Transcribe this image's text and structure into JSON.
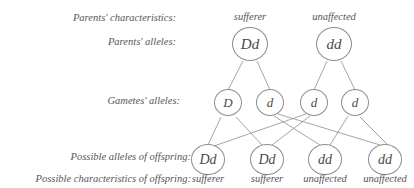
{
  "figure": {
    "type": "genetic-cross-diagram",
    "background": "#ffffff",
    "stroke_color": "#8e8e8e",
    "text_color": "#565656"
  },
  "row_labels": {
    "parents_characteristics": "Parents' characteristics:",
    "parents_alleles": "Parents' alleles:",
    "gametes_alleles": "Gametes' alleles:",
    "offspring_alleles": "Possible alleles of offspring:",
    "offspring_characteristics": "Possible characteristics of offspring:"
  },
  "parents": {
    "characteristics": [
      "sufferer",
      "unaffected"
    ],
    "genotypes": [
      "Dd",
      "dd"
    ]
  },
  "gametes": {
    "alleles": [
      "D",
      "d",
      "d",
      "d"
    ]
  },
  "offspring": {
    "genotypes": [
      "Dd",
      "Dd",
      "dd",
      "dd"
    ],
    "characteristics": [
      "sufferer",
      "sufferer",
      "unaffected",
      "unaffected"
    ]
  }
}
